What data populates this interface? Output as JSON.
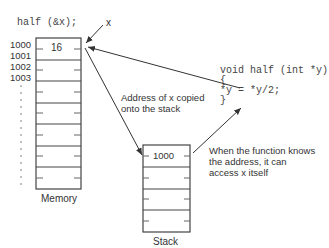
{
  "call_code": "half (&x);",
  "pointer_label": "x",
  "memory": {
    "label": "Memory",
    "addresses": [
      "1000",
      "1001",
      "1002",
      "1003"
    ],
    "cells": [
      "16",
      "",
      "",
      "",
      "",
      "",
      ""
    ]
  },
  "stack": {
    "label": "Stack",
    "cells": [
      "1000",
      "",
      "",
      ""
    ]
  },
  "function_code": {
    "line1": "void half (int *y)",
    "line2": "{",
    "line3": "*y = *y/2;",
    "line4": "}"
  },
  "annotations": {
    "copy_note_line1": "Address of x copied",
    "copy_note_line2": "onto the stack",
    "access_note_line1": "When the function knows",
    "access_note_line2": "the address, it can",
    "access_note_line3": "access x itself"
  },
  "colors": {
    "line": "#333333",
    "text": "#333333"
  }
}
